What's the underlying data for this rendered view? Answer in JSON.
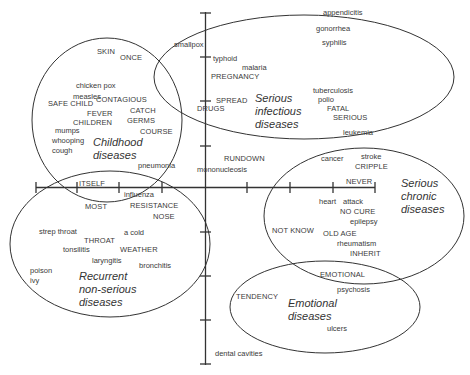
{
  "diagram": {
    "type": "concept-cluster-map",
    "clusters": [
      {
        "id": "childhood",
        "title": "Childhood\ndiseases",
        "terms": [
          "SKIN",
          "ONCE",
          "chicken pox",
          "measles",
          "SAFE CHILD",
          "CONTAGIOUS",
          "FEVER",
          "CATCH",
          "CHILDREN",
          "GERMS",
          "mumps",
          "whooping",
          "cough",
          "COURSE",
          "pneumonia"
        ]
      },
      {
        "id": "serious-infectious",
        "title": "Serious\ninfectious\ndiseases",
        "terms": [
          "smallpox",
          "typhoid",
          "malaria",
          "PREGNANCY",
          "SPREAD",
          "DRUGS",
          "tuberculosis",
          "polio",
          "FATAL",
          "SERIOUS",
          "gonorrhea",
          "syphilis"
        ]
      },
      {
        "id": "serious-chronic",
        "title": "Serious\nchronic\ndiseases",
        "terms": [
          "leukemia",
          "cancer",
          "stroke",
          "CRIPPLE",
          "NEVER",
          "heart",
          "attack",
          "NO CURE",
          "epilepsy",
          "NOT KNOW",
          "OLD AGE",
          "rheumatism",
          "INHERIT"
        ]
      },
      {
        "id": "recurrent",
        "title": "Recurrent\nnon-serious\ndiseases",
        "terms": [
          "ITSELF",
          "influenza",
          "MOST",
          "RESISTANCE",
          "NOSE",
          "strep throat",
          "a cold",
          "THROAT",
          "tonsilitis",
          "WEATHER",
          "laryngitis",
          "bronchitis",
          "poison",
          "ivy"
        ]
      },
      {
        "id": "emotional",
        "title": "Emotional\ndiseases",
        "terms": [
          "EMOTIONAL",
          "psychosis",
          "TENDENCY",
          "ulcers"
        ]
      }
    ],
    "unclustered_terms": [
      "appendicitis",
      "RUNDOWN",
      "mononucleosis",
      "dental cavities"
    ]
  },
  "labels": {
    "skin": "SKIN",
    "once": "ONCE",
    "chicken_pox": "chicken pox",
    "measles": "measles",
    "safe_child": "SAFE CHILD",
    "contagious": "CONTAGIOUS",
    "fever": "FEVER",
    "catch": "CATCH",
    "children": "CHILDREN",
    "germs": "GERMS",
    "mumps": "mumps",
    "whooping": "whooping",
    "cough": "cough",
    "course": "COURSE",
    "pneumonia": "pneumonia",
    "childhood_title": "Childhood\ndiseases",
    "smallpox": "smallpox",
    "typhoid": "typhoid",
    "malaria": "malaria",
    "pregnancy": "PREGNANCY",
    "spread": "SPREAD",
    "drugs": "DRUGS",
    "tuberculosis": "tuberculosis",
    "polio": "polio",
    "fatal": "FATAL",
    "serious": "SERIOUS",
    "gonorrhea": "gonorrhea",
    "syphilis": "syphilis",
    "appendicitis": "appendicitis",
    "infectious_title": "Serious\ninfectious\ndiseases",
    "leukemia": "leukemia",
    "cancer": "cancer",
    "stroke": "stroke",
    "cripple": "CRIPPLE",
    "never": "NEVER",
    "heart": "heart",
    "attack": "attack",
    "no_cure": "NO CURE",
    "epilepsy": "epilepsy",
    "not_know": "NOT KNOW",
    "old_age": "OLD AGE",
    "rheumatism": "rheumatism",
    "inherit": "INHERIT",
    "chronic_title": "Serious\nchronic\ndiseases",
    "rundown": "RUNDOWN",
    "mononucleosis": "mononucleosis",
    "itself": "ITSELF",
    "influenza": "influenza",
    "most": "MOST",
    "resistance": "RESISTANCE",
    "nose": "NOSE",
    "strep_throat": "strep throat",
    "a_cold": "a cold",
    "throat": "THROAT",
    "tonsilitis": "tonsilitis",
    "weather": "WEATHER",
    "laryngitis": "laryngitis",
    "bronchitis": "bronchitis",
    "poison": "poison",
    "ivy": "ivy",
    "recurrent_title": "Recurrent\nnon-serious\ndiseases",
    "emotional": "EMOTIONAL",
    "psychosis": "psychosis",
    "tendency": "TENDENCY",
    "ulcers": "ulcers",
    "emotional_title": "Emotional\ndiseases",
    "dental_cavities": "dental cavities"
  },
  "colors": {
    "line": "#333333",
    "text": "#3a3a3a",
    "background": "#ffffff"
  }
}
